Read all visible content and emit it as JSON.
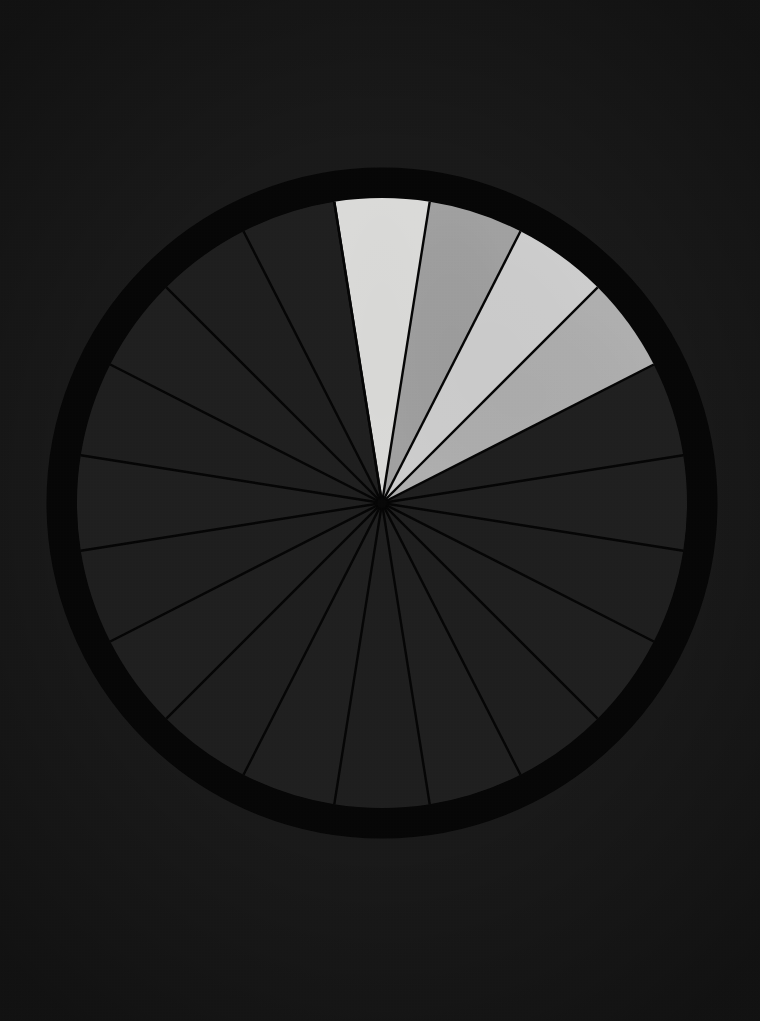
{
  "canvas": {
    "width": 760,
    "height": 1021,
    "background_color": "#181818"
  },
  "figure": {
    "center_x": 382,
    "center_y": 503,
    "wedge_radius": 305,
    "ring_inner_radius": 305,
    "ring_outer_radius": 336,
    "ring_color": "#050505",
    "divider_color": "#040404",
    "divider_width": 2.4,
    "title": "",
    "subtitle": "",
    "caption": ""
  },
  "chart_data": {
    "type": "pie",
    "title": "",
    "xlabel": "",
    "ylabel": "",
    "legend_position": "none",
    "grid": false,
    "total_sectors": 20,
    "sector_angle_degrees": 18,
    "start_angle_degrees": -99,
    "direction": "clockwise",
    "categories": [
      "S01",
      "S02",
      "S03",
      "S04",
      "S05",
      "S06",
      "S07",
      "S08",
      "S09",
      "S10",
      "S11",
      "S12",
      "S13",
      "S14",
      "S15",
      "S16",
      "S17",
      "S18",
      "S19",
      "S20"
    ],
    "values": [
      5,
      5,
      5,
      5,
      5,
      5,
      5,
      5,
      5,
      5,
      5,
      5,
      5,
      5,
      5,
      5,
      5,
      5,
      5,
      5
    ],
    "highlighted_indices": [
      0,
      1,
      2,
      3
    ],
    "colors": [
      "#d8d8d6",
      "#9b9b9b",
      "#cacaca",
      "#aaaaaa",
      "#1e1e1e",
      "#1e1e1e",
      "#1d1d1d",
      "#1e1e1e",
      "#1d1d1d",
      "#1e1e1e",
      "#1d1d1d",
      "#1e1e1e",
      "#1d1d1d",
      "#1e1e1e",
      "#1d1d1d",
      "#1e1e1e",
      "#1d1d1d",
      "#1e1e1e",
      "#1d1d1d",
      "#1e1e1e"
    ],
    "highlight_colors": [
      "#d8d8d6",
      "#9b9b9b",
      "#cacaca",
      "#aaaaaa"
    ],
    "dim_color": "#1e1e1e",
    "annotations": []
  }
}
